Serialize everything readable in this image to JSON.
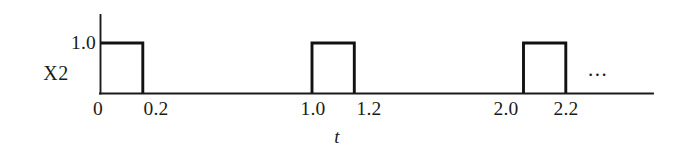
{
  "figure": {
    "series_label": "X2",
    "xaxis_title": "t",
    "continuation_marker": "..."
  },
  "axes": {
    "y_ticks": [
      "1.0"
    ],
    "x_ticks": [
      "0",
      "0.2",
      "1.0",
      "1.2",
      "2.0",
      "2.2"
    ]
  },
  "colors": {
    "background": "#ffffff",
    "ink": "#151515",
    "signal": "#121212"
  },
  "chart_data": {
    "type": "line",
    "title": "",
    "subtitle": "",
    "xlabel": "t",
    "ylabel": "X2",
    "series_name": "X2",
    "xlim": [
      0,
      2.085
    ],
    "ylim": [
      0,
      1.22
    ],
    "grid": false,
    "legend": null,
    "x_tick_values": [
      0,
      0.2,
      1.0,
      1.2,
      2.0,
      2.2
    ],
    "x_tick_labels": [
      "0",
      "0.2",
      "1.0",
      "1.2",
      "2.0",
      "2.2"
    ],
    "y_tick_values": [
      1.0
    ],
    "y_tick_labels": [
      "1.0"
    ],
    "amplitude": 1.0,
    "pulse_width": 0.2,
    "period": 1.0,
    "pulses": [
      {
        "rise": 0.0,
        "fall": 0.2,
        "value": 1.0
      },
      {
        "rise": 1.0,
        "fall": 1.2,
        "value": 1.0
      },
      {
        "rise": 2.0,
        "fall": 2.2,
        "value": 1.0
      }
    ],
    "x": [
      0.0,
      0.0,
      0.2,
      0.2,
      1.0,
      1.0,
      1.2,
      1.2,
      2.0,
      2.0,
      2.2,
      2.2
    ],
    "values": [
      0,
      1.0,
      1.0,
      0,
      0,
      1.0,
      1.0,
      0,
      0,
      1.0,
      1.0,
      0
    ],
    "annotations": [
      {
        "text": "...",
        "x": 2.33,
        "y": 0.55,
        "meaning": "waveform continues"
      }
    ]
  }
}
